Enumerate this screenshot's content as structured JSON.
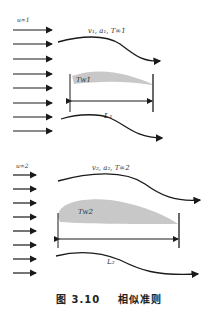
{
  "panel1": {
    "inflow_label": "u∞1",
    "flow_props_label": "v₁, a₁, T∞1",
    "wall_temp_label": "Tw1",
    "length_label": "L₁",
    "arrow_count": 8
  },
  "panel2": {
    "inflow_label": "u∞2",
    "flow_props_label": "v₂, a₂, T∞2",
    "wall_temp_label": "Tw2",
    "length_label": "L₂",
    "arrow_count": 8
  },
  "caption": {
    "figure_number": "图 3.10",
    "title": "相似准则"
  },
  "colors": {
    "line": "#1a1a1a",
    "body_fill": "#c8c8c8",
    "text": "#333333"
  }
}
